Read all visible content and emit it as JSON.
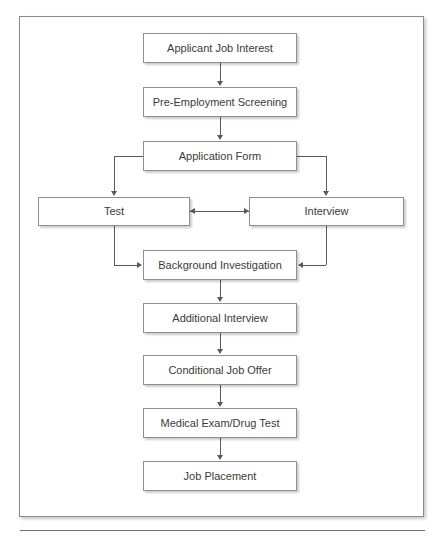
{
  "figure": {
    "top_artifact_text": "",
    "nodes": [
      {
        "id": "applicant_job_interest",
        "label": "Applicant Job Interest",
        "x": 143,
        "y": 33,
        "w": 154,
        "h": 30
      },
      {
        "id": "pre_employment_screening",
        "label": "Pre-Employment Screening",
        "x": 143,
        "y": 87,
        "w": 154,
        "h": 30
      },
      {
        "id": "application_form",
        "label": "Application Form",
        "x": 143,
        "y": 141,
        "w": 154,
        "h": 30
      },
      {
        "id": "test",
        "label": "Test",
        "x": 38,
        "y": 197,
        "w": 152,
        "h": 29
      },
      {
        "id": "interview",
        "label": "Interview",
        "x": 249,
        "y": 197,
        "w": 155,
        "h": 29
      },
      {
        "id": "background_investigation",
        "label": "Background Investigation",
        "x": 143,
        "y": 250,
        "w": 154,
        "h": 30
      },
      {
        "id": "additional_interview",
        "label": "Additional Interview",
        "x": 143,
        "y": 303,
        "w": 154,
        "h": 30
      },
      {
        "id": "conditional_job_offer",
        "label": "Conditional Job Offer",
        "x": 143,
        "y": 355,
        "w": 154,
        "h": 30
      },
      {
        "id": "medical_exam_drug_test",
        "label": "Medical Exam/Drug Test",
        "x": 143,
        "y": 408,
        "w": 154,
        "h": 30
      },
      {
        "id": "job_placement",
        "label": "Job Placement",
        "x": 143,
        "y": 461,
        "w": 154,
        "h": 30
      }
    ],
    "connections": [
      {
        "id": "applicant-to-screening",
        "from": "applicant_job_interest",
        "to": "pre_employment_screening",
        "kind": "straight-down"
      },
      {
        "id": "screening-to-application",
        "from": "pre_employment_screening",
        "to": "application_form",
        "kind": "straight-down"
      },
      {
        "id": "application-to-test",
        "from": "application_form",
        "to": "test",
        "kind": "elbow-left-down"
      },
      {
        "id": "application-to-interview",
        "from": "application_form",
        "to": "interview",
        "kind": "elbow-right-down"
      },
      {
        "id": "test-interview-bidirectional",
        "from": "test",
        "to": "interview",
        "kind": "double-headed-horizontal"
      },
      {
        "id": "test-to-background",
        "from": "test",
        "to": "background_investigation",
        "kind": "elbow-down-right"
      },
      {
        "id": "interview-to-background",
        "from": "interview",
        "to": "background_investigation",
        "kind": "elbow-down-left"
      },
      {
        "id": "background-to-additional",
        "from": "background_investigation",
        "to": "additional_interview",
        "kind": "straight-down"
      },
      {
        "id": "additional-to-conditional",
        "from": "additional_interview",
        "to": "conditional_job_offer",
        "kind": "straight-down"
      },
      {
        "id": "conditional-to-medical",
        "from": "conditional_job_offer",
        "to": "medical_exam_drug_test",
        "kind": "straight-down"
      },
      {
        "id": "medical-to-placement",
        "from": "medical_exam_drug_test",
        "to": "job_placement",
        "kind": "straight-down"
      }
    ],
    "colors": {
      "node_border": "#8e8e8e",
      "node_fill": "#ffffff",
      "connector": "#5a5a5a",
      "text": "#3a3a3a",
      "frame_border": "#8c8c8c",
      "rule": "#6f6f6f"
    }
  }
}
